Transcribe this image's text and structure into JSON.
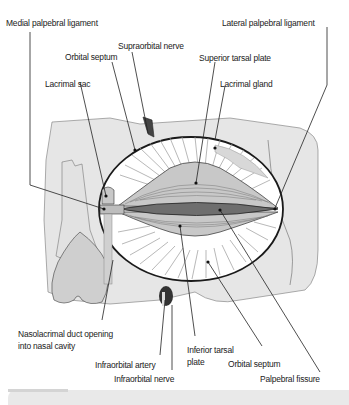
{
  "figure": {
    "labels": {
      "medial_palpebral_ligament": "Medial palpebral ligament",
      "lateral_palpebral_ligament": "Lateral palpebral ligament",
      "supraorbital_nerve": "Supraorbital nerve",
      "orbital_septum_top": "Orbital septum",
      "superior_tarsal_plate": "Superior tarsal plate",
      "lacrimal_sac": "Lacrimal sac",
      "lacrimal_gland": "Lacrimal gland",
      "nasolacrimal_duct_line1": "Nasolacrimal duct opening",
      "nasolacrimal_duct_line2": "into nasal cavity",
      "inferior_tarsal_plate_line1": "Inferior tarsal",
      "inferior_tarsal_plate_line2": "plate",
      "orbital_septum_bottom": "Orbital septum",
      "infraorbital_artery": "Infraorbital artery",
      "infraorbital_nerve": "Infraorbital nerve",
      "palpebral_fissure": "Palpebral fissure"
    },
    "colors": {
      "bone": "#e6e6e6",
      "outline": "#222222",
      "tarsal_plate": "#bfbfbf",
      "fissure": "#6e6e6e",
      "nasal_cavity": "#cfcfcf",
      "label_text": "#222222"
    }
  }
}
